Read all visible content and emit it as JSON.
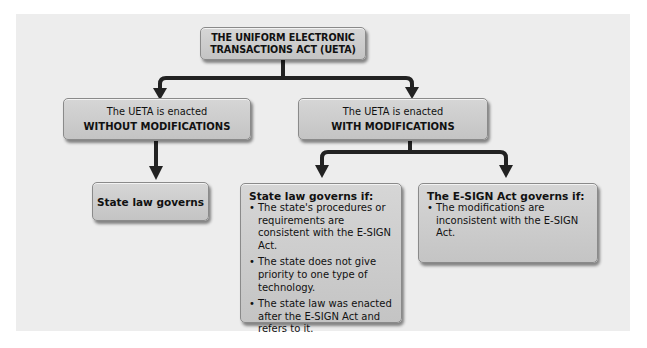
{
  "diagram": {
    "root": {
      "line1": "THE UNIFORM ELECTRONIC",
      "line2": "TRANSACTIONS ACT (UETA)"
    },
    "branch_left": {
      "line1": "The UETA is enacted",
      "line2": "WITHOUT MODIFICATIONS",
      "outcome": "State law governs"
    },
    "branch_right": {
      "line1": "The UETA is enacted",
      "line2": "WITH MODIFICATIONS",
      "state_law": {
        "title": "State law governs if:",
        "items": [
          "The state's procedures or requirements are consistent with the E-SIGN Act.",
          "The state does not give priority to one type of technology.",
          "The state law was enacted after the E-SIGN Act and refers to it."
        ]
      },
      "esign": {
        "title": "The E-SIGN Act governs if:",
        "items": [
          "The modifications are inconsistent with the E-SIGN Act."
        ]
      }
    },
    "colors": {
      "panel": "#ededed",
      "box": "#cccccc",
      "arrow": "#222222"
    }
  }
}
